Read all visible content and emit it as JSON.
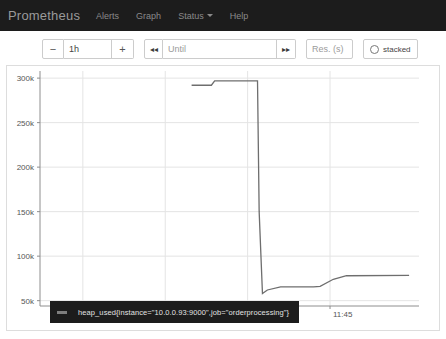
{
  "navbar": {
    "brand": "Prometheus",
    "items": [
      {
        "label": "Alerts",
        "name": "nav-alerts",
        "caret": false
      },
      {
        "label": "Graph",
        "name": "nav-graph",
        "caret": false
      },
      {
        "label": "Status",
        "name": "nav-status",
        "caret": true
      },
      {
        "label": "Help",
        "name": "nav-help",
        "caret": false
      }
    ]
  },
  "toolbar": {
    "decrease_label": "−",
    "range_value": "1h",
    "increase_label": "+",
    "step_back_label": "◂◂",
    "until_placeholder": "Until",
    "until_value": "",
    "step_forward_label": "▸▸",
    "resolution_placeholder": "Res. (s)",
    "resolution_value": "",
    "stacked_label": "stacked",
    "stacked_checked": false
  },
  "legend": {
    "series_label": "heap_used{instance=\"10.0.0.93:9000\",job=\"orderprocessing\"}",
    "swatch_color": "#7e7e7e"
  },
  "chart_data": {
    "type": "line",
    "title": "",
    "xlabel": "",
    "ylabel": "",
    "grid": true,
    "legend_position": "bottom",
    "line_color": "#6e6e6e",
    "x_tick_labels": [
      "11:00",
      "11:15",
      "11:30",
      "11:45"
    ],
    "x_tick_positions": [
      11.0,
      11.25,
      11.5,
      11.75
    ],
    "y_tick_labels": [
      "50k",
      "100k",
      "150k",
      "200k",
      "250k",
      "300k"
    ],
    "y_tick_values": [
      50000,
      100000,
      150000,
      200000,
      250000,
      300000
    ],
    "xlim": [
      10.87,
      12.02
    ],
    "ylim": [
      44000,
      308000
    ],
    "series": [
      {
        "name": "heap_used{instance=\"10.0.0.93:9000\",job=\"orderprocessing\"}",
        "x": [
          11.33,
          11.39,
          11.4,
          11.53,
          11.535,
          11.545,
          11.56,
          11.6,
          11.7,
          11.72,
          11.76,
          11.8,
          11.99
        ],
        "y": [
          292000,
          292000,
          297000,
          297000,
          150000,
          58000,
          62000,
          65500,
          65500,
          66000,
          74000,
          78000,
          78500
        ]
      }
    ]
  }
}
